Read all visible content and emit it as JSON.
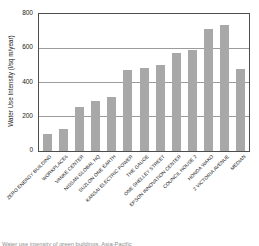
{
  "figure": {
    "caption": "Water use intensity of green buildings, Asia-Pacific"
  },
  "chart_data": {
    "type": "bar",
    "title": "",
    "categories": [
      "ZERO ENERGY BUILDING",
      "WORKPLACE6",
      "VANKE CENTER",
      "NISSAN GLOBAL HQ",
      "SUZLON ONE EARTH",
      "KANSAI ELECTRIC POWER",
      "THE GAUGE",
      "ONE SHELLEY STREET",
      "EPSON INNOVATION CENTER",
      "COUNCIL HOUSE 2",
      "HONDA WAKO",
      "2 VICTORIA AVENUE",
      "MEDIAN"
    ],
    "values": [
      100,
      130,
      255,
      290,
      315,
      475,
      485,
      505,
      575,
      590,
      710,
      735,
      480
    ],
    "xlabel": "",
    "ylabel": "Water Use Intensity (l/sq m/year)",
    "ylim": [
      0,
      800
    ],
    "yticks": [
      0,
      200,
      400,
      600,
      800
    ],
    "grid": true,
    "legend": false
  },
  "colors": {
    "bar": "#a8a8a8",
    "grid": "#9c9c9c",
    "axis_border": "#4d4d4d",
    "text": "#1a1a1a",
    "caption_text": "#8f8f8f",
    "background": "#ffffff"
  }
}
